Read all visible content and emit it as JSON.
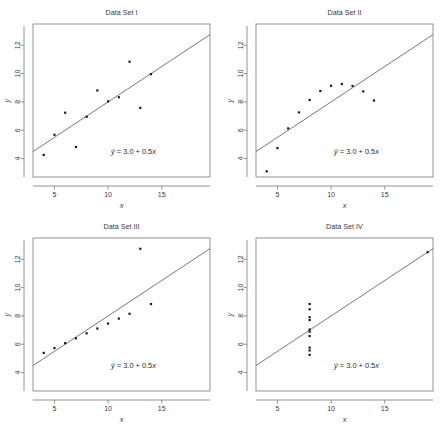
{
  "figure": {
    "panel_count": 4
  },
  "axes": {
    "xlabel": "x",
    "ylabel": "y",
    "x_ticks": [
      5,
      10,
      15
    ],
    "y_ticks": [
      4,
      6,
      8,
      10,
      12
    ],
    "xlim": [
      3.0,
      19.5
    ],
    "ylim": [
      2.7,
      13.5
    ],
    "grid": false
  },
  "equation": {
    "yhat": "ŷ",
    "text": "= 3.0 + 0.5",
    "xvar": "x",
    "full": "ŷ = 3.0 + 0.5x"
  },
  "colors": {
    "point": "#1a1a1a",
    "line": "#555555",
    "frame": "#7a7a7a",
    "text": "#3a3a3a",
    "background": "#ffffff"
  },
  "chart_data": [
    {
      "type": "scatter",
      "title": "Data Set I",
      "xlabel": "x",
      "ylabel": "y",
      "xlim": [
        3.0,
        19.5
      ],
      "ylim": [
        2.7,
        13.5
      ],
      "grid": false,
      "x": [
        10,
        8,
        13,
        9,
        11,
        14,
        6,
        4,
        12,
        7,
        5
      ],
      "y": [
        8.04,
        6.95,
        7.58,
        8.81,
        8.33,
        9.96,
        7.24,
        4.26,
        10.84,
        4.82,
        5.68
      ],
      "fit": {
        "intercept": 3.0,
        "slope": 0.5,
        "label": "ŷ = 3.0 + 0.5x"
      }
    },
    {
      "type": "scatter",
      "title": "Data Set II",
      "xlabel": "x",
      "ylabel": "y",
      "xlim": [
        3.0,
        19.5
      ],
      "ylim": [
        2.7,
        13.5
      ],
      "grid": false,
      "x": [
        10,
        8,
        13,
        9,
        11,
        14,
        6,
        4,
        12,
        7,
        5
      ],
      "y": [
        9.14,
        8.14,
        8.74,
        8.77,
        9.26,
        8.1,
        6.13,
        3.1,
        9.13,
        7.26,
        4.74
      ],
      "fit": {
        "intercept": 3.0,
        "slope": 0.5,
        "label": "ŷ = 3.0 + 0.5x"
      }
    },
    {
      "type": "scatter",
      "title": "Data Set III",
      "xlabel": "x",
      "ylabel": "y",
      "xlim": [
        3.0,
        19.5
      ],
      "ylim": [
        2.7,
        13.5
      ],
      "grid": false,
      "x": [
        10,
        8,
        13,
        9,
        11,
        14,
        6,
        4,
        12,
        7,
        5
      ],
      "y": [
        7.46,
        6.77,
        12.74,
        7.11,
        7.81,
        8.84,
        6.08,
        5.39,
        8.15,
        6.42,
        5.73
      ],
      "fit": {
        "intercept": 3.0,
        "slope": 0.5,
        "label": "ŷ = 3.0 + 0.5x"
      }
    },
    {
      "type": "scatter",
      "title": "Data Set IV",
      "xlabel": "x",
      "ylabel": "y",
      "xlim": [
        3.0,
        19.5
      ],
      "ylim": [
        2.7,
        13.5
      ],
      "grid": false,
      "x": [
        8,
        8,
        8,
        8,
        8,
        8,
        8,
        19,
        8,
        8,
        8
      ],
      "y": [
        6.58,
        5.76,
        7.71,
        8.84,
        8.47,
        7.04,
        5.25,
        12.5,
        5.56,
        7.91,
        6.89
      ],
      "fit": {
        "intercept": 3.0,
        "slope": 0.5,
        "label": "ŷ = 3.0 + 0.5x"
      }
    }
  ]
}
